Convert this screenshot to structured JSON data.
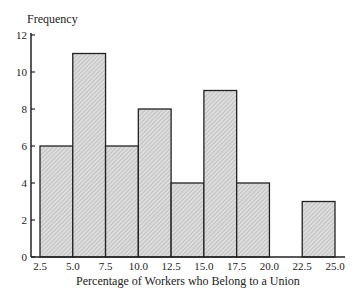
{
  "chart_data": {
    "type": "bar",
    "subtype": "histogram",
    "title": "",
    "xlabel": "Percentage of Workers who Belong to a Union",
    "ylabel": "Frequency",
    "bins": [
      {
        "start": 2.5,
        "end": 5.0,
        "count": 6
      },
      {
        "start": 5.0,
        "end": 7.5,
        "count": 11
      },
      {
        "start": 7.5,
        "end": 10.0,
        "count": 6
      },
      {
        "start": 10.0,
        "end": 12.5,
        "count": 8
      },
      {
        "start": 12.5,
        "end": 15.0,
        "count": 4
      },
      {
        "start": 15.0,
        "end": 17.5,
        "count": 9
      },
      {
        "start": 17.5,
        "end": 20.0,
        "count": 4
      },
      {
        "start": 20.0,
        "end": 22.5,
        "count": 0
      },
      {
        "start": 22.5,
        "end": 25.0,
        "count": 3
      }
    ],
    "categories": [
      "2.5-5.0",
      "5.0-7.5",
      "7.5-10.0",
      "10.0-12.5",
      "12.5-15.0",
      "15.0-17.5",
      "17.5-20.0",
      "20.0-22.5",
      "22.5-25.0"
    ],
    "values": [
      6,
      11,
      6,
      8,
      4,
      9,
      4,
      0,
      3
    ],
    "x_ticks": [
      "2.5",
      "5.0",
      "7.5",
      "10.0",
      "12.5",
      "15.0",
      "17.5",
      "20.0",
      "22.5",
      "25.0"
    ],
    "y_ticks": [
      "0",
      "2",
      "4",
      "6",
      "8",
      "10",
      "12"
    ],
    "xlim": [
      2.5,
      25.0
    ],
    "ylim": [
      0,
      12
    ],
    "grid": false,
    "legend": null,
    "bar_fill": "#d2d2d2",
    "bar_edge": "#222222"
  }
}
